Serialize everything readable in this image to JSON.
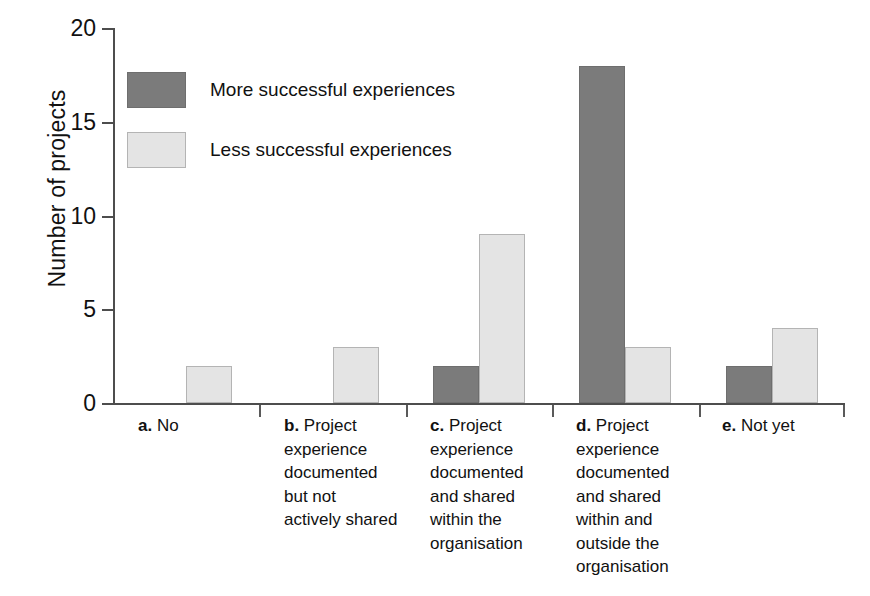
{
  "chart_data": {
    "type": "bar",
    "title": "",
    "xlabel": "",
    "ylabel": "Number of projects",
    "ylim": [
      0,
      20
    ],
    "yticks": [
      0,
      5,
      10,
      15,
      20
    ],
    "grid": false,
    "legend_position": "top-left",
    "categories": [
      "a. No",
      "b. Project experience documented but not actively shared",
      "c. Project experience documented and shared within the organisation",
      "d. Project experience documented and shared within and outside the organisation",
      "e. Not yet"
    ],
    "series": [
      {
        "name": "More successful experiences",
        "color": "#7b7b7b",
        "values": [
          0,
          0,
          2,
          18,
          2
        ]
      },
      {
        "name": "Less successful experiences",
        "color": "#e4e4e4",
        "values": [
          2,
          3,
          9,
          3,
          4
        ]
      }
    ]
  },
  "axis": {
    "y_title": "Number of projects",
    "y_ticks": [
      {
        "value": 20,
        "label": "20"
      },
      {
        "value": 15,
        "label": "15"
      },
      {
        "value": 10,
        "label": "10"
      },
      {
        "value": 5,
        "label": "5"
      },
      {
        "value": 0,
        "label": "0"
      }
    ]
  },
  "legend": {
    "items": [
      {
        "label": "More successful experiences",
        "swatch": "more"
      },
      {
        "label": "Less successful experiences",
        "swatch": "less"
      }
    ]
  },
  "x_labels": [
    {
      "key": "a.",
      "lines": [
        "No"
      ]
    },
    {
      "key": "b.",
      "lines": [
        "Project",
        "experience",
        "documented",
        "but not",
        "actively shared"
      ]
    },
    {
      "key": "c.",
      "lines": [
        "Project",
        "experience",
        "documented",
        "and shared",
        "within the",
        "organisation"
      ]
    },
    {
      "key": "d.",
      "lines": [
        "Project",
        "experience",
        "documented",
        "and shared",
        "within and",
        "outside the",
        "organisation"
      ]
    },
    {
      "key": "e.",
      "lines": [
        "Not yet"
      ]
    }
  ],
  "colors": {
    "more": "#7b7b7b",
    "less": "#e4e4e4",
    "axis": "#4d4d4d",
    "text": "#111111",
    "background": "#ffffff"
  }
}
